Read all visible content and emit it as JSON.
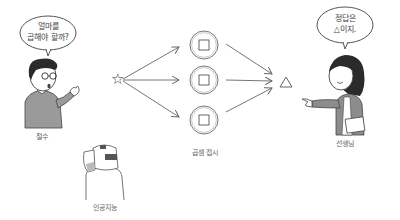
{
  "characters": {
    "student": {
      "name": "철수",
      "speech": [
        "얼마를",
        "곱해야 할까?"
      ]
    },
    "teacher": {
      "name": "선생님",
      "speech": [
        "정답은",
        "△이지."
      ]
    },
    "ai": {
      "name": "인공지능"
    }
  },
  "diagram": {
    "input_symbol": "☆",
    "plate_symbol": "□",
    "plate_count": 3,
    "output_symbol": "△",
    "plates_label": "곱셈 접시"
  },
  "colors": {
    "line": "#555555",
    "hair": "#2b2b2b",
    "shirt": "#9a9a9a",
    "jacket": "#8c8c8c"
  }
}
